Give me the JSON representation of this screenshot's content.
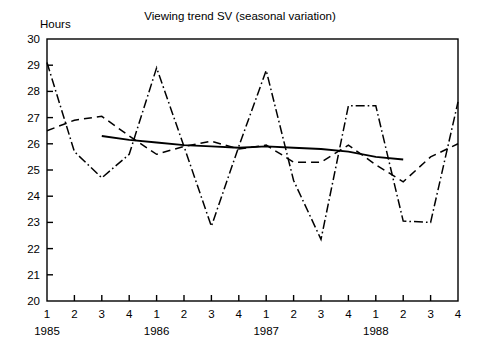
{
  "chart_data": {
    "type": "line",
    "title": "Viewing trend SV (seasonal variation)",
    "ylabel": "Hours",
    "xlabel": "",
    "ylim": [
      20,
      30
    ],
    "ytick_labels": [
      "30",
      "29",
      "28",
      "27",
      "26",
      "25",
      "24",
      "23",
      "22",
      "21",
      "20"
    ],
    "ytick_values": [
      30,
      29,
      28,
      27,
      26,
      25,
      24,
      23,
      22,
      21,
      20
    ],
    "grid": false,
    "legend_position": "none",
    "x": [
      "1985 Q1",
      "1985 Q2",
      "1985 Q3",
      "1985 Q4",
      "1986 Q1",
      "1986 Q2",
      "1986 Q3",
      "1986 Q4",
      "1987 Q1",
      "1987 Q2",
      "1987 Q3",
      "1987 Q4",
      "1988 Q1",
      "1988 Q2",
      "1988 Q3",
      "1988 Q4"
    ],
    "xtick_labels": [
      "1",
      "2",
      "3",
      "4",
      "1",
      "2",
      "3",
      "4",
      "1",
      "2",
      "3",
      "4",
      "1",
      "2",
      "3",
      "4"
    ],
    "year_labels": [
      {
        "label": "1985",
        "at_index": 0
      },
      {
        "label": "1986",
        "at_index": 4
      },
      {
        "label": "1987",
        "at_index": 8
      },
      {
        "label": "1988",
        "at_index": 12
      }
    ],
    "series": [
      {
        "name": "Actual (seasonal variation)",
        "style": "dash-dot",
        "color": "#000000",
        "values": [
          29.1,
          25.7,
          24.7,
          25.6,
          28.9,
          25.9,
          22.85,
          25.9,
          28.8,
          24.6,
          22.35,
          27.45,
          27.45,
          23.05,
          23.0,
          27.6
        ]
      },
      {
        "name": "Moving average",
        "style": "dashed",
        "color": "#000000",
        "values": [
          26.5,
          26.9,
          27.05,
          26.3,
          25.6,
          25.9,
          26.1,
          25.8,
          25.95,
          25.3,
          25.3,
          25.95,
          25.2,
          24.55,
          25.5,
          26.0
        ]
      },
      {
        "name": "Trend",
        "style": "solid",
        "color": "#000000",
        "values": [
          null,
          null,
          26.3,
          26.15,
          26.05,
          25.95,
          25.9,
          25.85,
          25.9,
          25.85,
          25.8,
          25.7,
          25.5,
          25.4,
          null,
          null
        ]
      }
    ]
  }
}
